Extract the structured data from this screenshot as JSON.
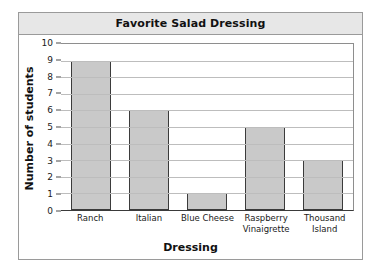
{
  "chart_data": {
    "type": "bar",
    "title": "Favorite Salad Dressing",
    "xlabel": "Dressing",
    "ylabel": "Number of students",
    "categories": [
      "Ranch",
      "Italian",
      "Blue Cheese",
      "Raspberry Vinaigrette",
      "Thousand Island"
    ],
    "category_lines": [
      [
        "Ranch"
      ],
      [
        "Italian"
      ],
      [
        "Blue Cheese"
      ],
      [
        "Raspberry",
        "Vinaigrette"
      ],
      [
        "Thousand",
        "Island"
      ]
    ],
    "values": [
      9,
      6,
      1,
      5,
      3
    ],
    "ylim": [
      0,
      10
    ],
    "ytick_labels": [
      "0",
      "1",
      "2",
      "3",
      "4",
      "5",
      "6",
      "7",
      "8",
      "9",
      "10"
    ],
    "ytick_values": [
      0,
      1,
      2,
      3,
      4,
      5,
      6,
      7,
      8,
      9,
      10
    ],
    "grid": true,
    "legend": null,
    "colors": {
      "bar_fill": "#c9c9c9",
      "bar_edge": "#3b3b3b",
      "gridline": "#bdbdbd",
      "axis": "#3a3a3a",
      "title_bar_bg": "#e7e7e7",
      "border": "#9a9a9a",
      "text": "#111111",
      "background": "#ffffff"
    }
  }
}
